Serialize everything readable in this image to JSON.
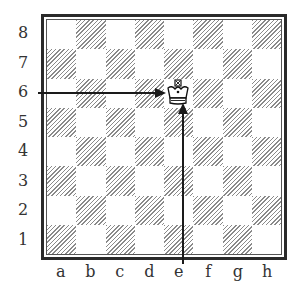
{
  "diagram": {
    "type": "chessboard",
    "ranks": [
      "8",
      "7",
      "6",
      "5",
      "4",
      "3",
      "2",
      "1"
    ],
    "files": [
      "a",
      "b",
      "c",
      "d",
      "e",
      "f",
      "g",
      "h"
    ],
    "pieces": [
      {
        "piece": "king",
        "color": "white",
        "square": "e6",
        "glyph": "♔"
      }
    ],
    "arrows": [
      {
        "from": "rank-6-left-margin",
        "to": "e6",
        "direction": "horizontal"
      },
      {
        "from": "file-e-bottom-margin",
        "to": "e6",
        "direction": "vertical"
      }
    ],
    "colors": {
      "border": "#2a2a2a",
      "dark_square_hatch": "#8a8a8a",
      "light_square": "#ffffff",
      "arrow": "#1a1a1a"
    }
  }
}
